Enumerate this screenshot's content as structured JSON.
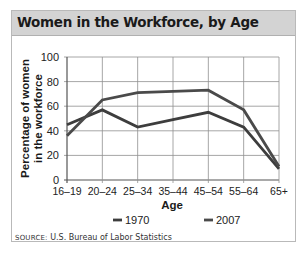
{
  "header": {
    "title": "Women in the Workforce, by Age"
  },
  "footer": {
    "source_label": "SOURCE:",
    "source_text": "U.S. Bureau of Labor Statistics"
  },
  "colors": {
    "title_bar": "#d3d3d3",
    "series_1970": "#3d3d3d",
    "series_2007": "#4a4a4a",
    "grid": "#8f8f8f"
  },
  "chart_data": {
    "type": "line",
    "title": "Women in the Workforce, by Age",
    "xlabel": "Age",
    "ylabel": "Percentage of women in the workforce",
    "ylabel_lines": [
      "Percentage of women",
      "in the workforce"
    ],
    "categories": [
      "16–19",
      "20–24",
      "25–34",
      "35–44",
      "45–54",
      "55–64",
      "65+"
    ],
    "series": [
      {
        "name": "1970",
        "values": [
          45,
          57,
          43,
          49,
          55,
          43,
          9
        ]
      },
      {
        "name": "2007",
        "values": [
          36,
          65,
          71,
          72,
          73,
          57,
          11
        ]
      }
    ],
    "ylim": [
      0,
      100
    ],
    "yticks": [
      0,
      20,
      40,
      60,
      80,
      100
    ],
    "grid": true,
    "legend_position": "bottom",
    "source": "SOURCE: U.S. Bureau of Labor Statistics"
  }
}
